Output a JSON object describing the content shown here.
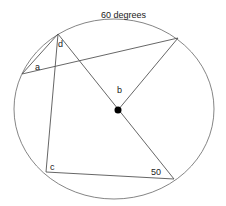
{
  "diagram": {
    "type": "circle-geometry",
    "title_label": "60 degrees",
    "labels": {
      "a": "a",
      "b": "b",
      "c": "c",
      "d": "d",
      "angle_50": "50"
    },
    "colors": {
      "stroke": "#555555",
      "center_dot": "#000000",
      "text": "#222222"
    }
  }
}
